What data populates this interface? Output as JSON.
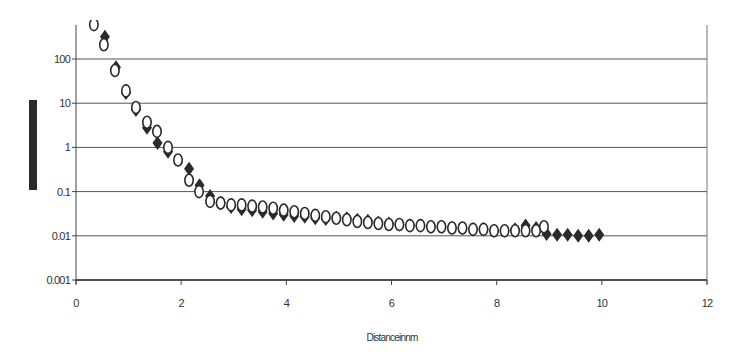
{
  "chart_data": {
    "type": "scatter",
    "title": "",
    "xlabel": "Distance in nm",
    "xlabel_rendered": "Distanceinnm",
    "ylabel": "",
    "ylabel_redacted": true,
    "xlim": [
      0,
      12
    ],
    "ylim": [
      0.001,
      1000
    ],
    "yscale": "log",
    "x_ticks": [
      0,
      2,
      4,
      6,
      8,
      10,
      12
    ],
    "x_tick_labels": [
      "0",
      "2",
      "4",
      "6",
      "8",
      "10",
      "12"
    ],
    "y_ticks": [
      0.001,
      0.01,
      0.1,
      1,
      10,
      100
    ],
    "y_tick_labels": [
      "0.001",
      "0.01",
      "0.1",
      "1",
      "10",
      "100"
    ],
    "grid": {
      "horizontal": true,
      "vertical": false
    },
    "legend": null,
    "series": [
      {
        "name": "filled diamonds",
        "marker": "filled-diamond",
        "color": "#2a2a2a",
        "x": [
          0.55,
          0.76,
          0.95,
          1.14,
          1.35,
          1.55,
          1.75,
          2.15,
          2.35,
          2.55,
          2.75,
          2.95,
          3.15,
          3.35,
          3.55,
          3.75,
          3.95,
          4.15,
          4.35,
          4.55,
          4.75,
          4.95,
          5.15,
          5.35,
          5.55,
          5.75,
          5.95,
          6.15,
          6.35,
          6.55,
          6.75,
          6.95,
          7.15,
          7.35,
          7.55,
          7.75,
          7.95,
          8.15,
          8.35,
          8.55,
          8.75,
          8.95,
          9.15,
          9.35,
          9.55,
          9.75,
          9.95
        ],
        "y": [
          320,
          65,
          17,
          7,
          2.8,
          1.25,
          0.8,
          0.33,
          0.14,
          0.08,
          0.055,
          0.045,
          0.04,
          0.038,
          0.035,
          0.032,
          0.03,
          0.028,
          0.027,
          0.025,
          0.024,
          0.026,
          0.025,
          0.023,
          0.022,
          0.02,
          0.019,
          0.018,
          0.017,
          0.017,
          0.016,
          0.016,
          0.015,
          0.015,
          0.014,
          0.014,
          0.013,
          0.013,
          0.014,
          0.017,
          0.015,
          0.011,
          0.0105,
          0.0105,
          0.01,
          0.01,
          0.0105
        ]
      },
      {
        "name": "open circles",
        "marker": "open-ellipse",
        "color": "#2a2a2a",
        "x": [
          0.34,
          0.53,
          0.74,
          0.95,
          1.14,
          1.35,
          1.54,
          1.75,
          1.94,
          2.15,
          2.34,
          2.55,
          2.75,
          2.95,
          3.15,
          3.35,
          3.55,
          3.75,
          3.95,
          4.15,
          4.35,
          4.55,
          4.75,
          4.95,
          5.15,
          5.35,
          5.55,
          5.75,
          5.95,
          6.15,
          6.35,
          6.55,
          6.75,
          6.95,
          7.15,
          7.35,
          7.55,
          7.75,
          7.95,
          8.15,
          8.35,
          8.55,
          8.75,
          8.9
        ],
        "y": [
          600,
          210,
          55,
          19,
          8,
          3.7,
          2.3,
          1.0,
          0.52,
          0.18,
          0.1,
          0.06,
          0.055,
          0.05,
          0.05,
          0.047,
          0.045,
          0.042,
          0.038,
          0.035,
          0.032,
          0.029,
          0.027,
          0.025,
          0.023,
          0.021,
          0.02,
          0.019,
          0.018,
          0.018,
          0.017,
          0.017,
          0.016,
          0.016,
          0.015,
          0.015,
          0.014,
          0.014,
          0.013,
          0.013,
          0.013,
          0.013,
          0.013,
          0.016
        ]
      }
    ]
  },
  "axes": {
    "x_title": "Distanceinnm"
  }
}
